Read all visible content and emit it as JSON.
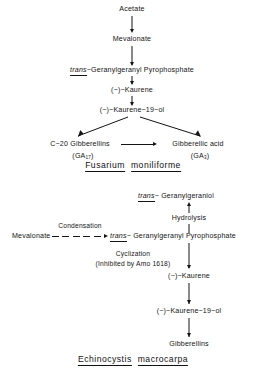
{
  "figure": {
    "type": "pathway-diagram",
    "panels": [
      {
        "id": "fusarium",
        "caption_genus": "Fusarium",
        "caption_species": "moniliforme",
        "nodes": [
          {
            "id": "acetate",
            "text": "Acetate"
          },
          {
            "id": "mevalonate",
            "text": "Mevalonate"
          },
          {
            "id": "ggpp_prefix",
            "text": "trans",
            "text_rest": "−Geranylgeranyl  Pyrophosphate"
          },
          {
            "id": "kaurene",
            "text": "(−)−Kaurene"
          },
          {
            "id": "kaurenol",
            "text": "(−)−Kaurene−19−ol"
          },
          {
            "id": "c20gibb",
            "text": "C−20 Gibberellins"
          },
          {
            "id": "c20gibb_code",
            "text": "(GA",
            "sub": "17",
            "tail": ")"
          },
          {
            "id": "gibb_acid",
            "text": "Gibberellic acid"
          },
          {
            "id": "gibb_acid_code",
            "text": "(GA",
            "sub": "3",
            "tail": ")"
          }
        ]
      },
      {
        "id": "echinocystis",
        "caption_genus": "Echinocystis",
        "caption_species": "macrocarpa",
        "nodes": [
          {
            "id": "ggol_prefix",
            "text": "trans",
            "text_rest": "− Geranylgeraniol"
          },
          {
            "id": "hydrolysis",
            "text": "Hydrolysis"
          },
          {
            "id": "mevalonate2",
            "text": "Mevalonate"
          },
          {
            "id": "condensation",
            "text": "Condensation"
          },
          {
            "id": "ggpp2_prefix",
            "text": "trans",
            "text_rest": "− Geranylgeranyl  Pyrophosphate"
          },
          {
            "id": "cyclization",
            "text": "Cyclization"
          },
          {
            "id": "inhibitor",
            "text": "(Inhibited by Amo 1618)"
          },
          {
            "id": "kaurene2",
            "text": "(−)−Kaurene"
          },
          {
            "id": "kaurenol2",
            "text": "(−)−Kaurene−19−ol"
          },
          {
            "id": "gibberellins",
            "text": "Gibberellins"
          }
        ]
      }
    ],
    "colors": {
      "ink": "#141414",
      "background": "#ffffff"
    }
  }
}
